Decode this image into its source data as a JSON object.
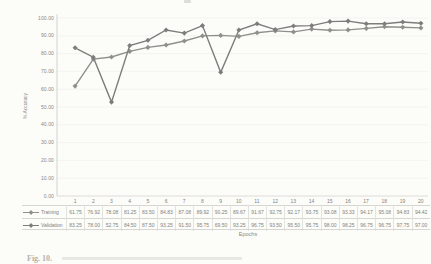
{
  "figure": {
    "caption_partial": "Fig. 10.",
    "background": "#fcfcf9",
    "colors": {
      "text": "#85847f",
      "grid": "#ededea",
      "axis": "#c9c8c4",
      "table_border": "#d7d6d2"
    }
  },
  "chart_data": {
    "type": "line",
    "title": "",
    "xlabel": "Epochs",
    "ylabel": "% Accuracy",
    "ylim": [
      0,
      100
    ],
    "yticks": [
      0,
      10,
      20,
      30,
      40,
      50,
      60,
      70,
      80,
      90,
      100
    ],
    "grid": "horizontal-faint",
    "legend_position": "table-left",
    "data_table_shown": true,
    "categories": [
      1,
      2,
      3,
      4,
      5,
      6,
      7,
      8,
      9,
      10,
      11,
      12,
      13,
      14,
      15,
      16,
      17,
      18,
      19,
      20
    ],
    "series": [
      {
        "name": "Training",
        "color": "#908f8c",
        "marker": "diamond",
        "values": [
          61.75,
          76.92,
          78.08,
          81.25,
          83.5,
          84.83,
          87.08,
          89.92,
          90.25,
          89.67,
          91.67,
          92.75,
          92.17,
          93.75,
          93.08,
          93.33,
          94.17,
          95.08,
          94.83,
          94.42
        ]
      },
      {
        "name": "Validation",
        "color": "#7e7d7b",
        "marker": "diamond",
        "values": [
          83.25,
          78.0,
          52.75,
          84.5,
          87.5,
          93.25,
          91.5,
          95.75,
          69.5,
          93.25,
          96.75,
          93.5,
          95.5,
          95.75,
          98.0,
          98.25,
          96.75,
          96.75,
          97.75,
          97.0
        ]
      }
    ]
  }
}
